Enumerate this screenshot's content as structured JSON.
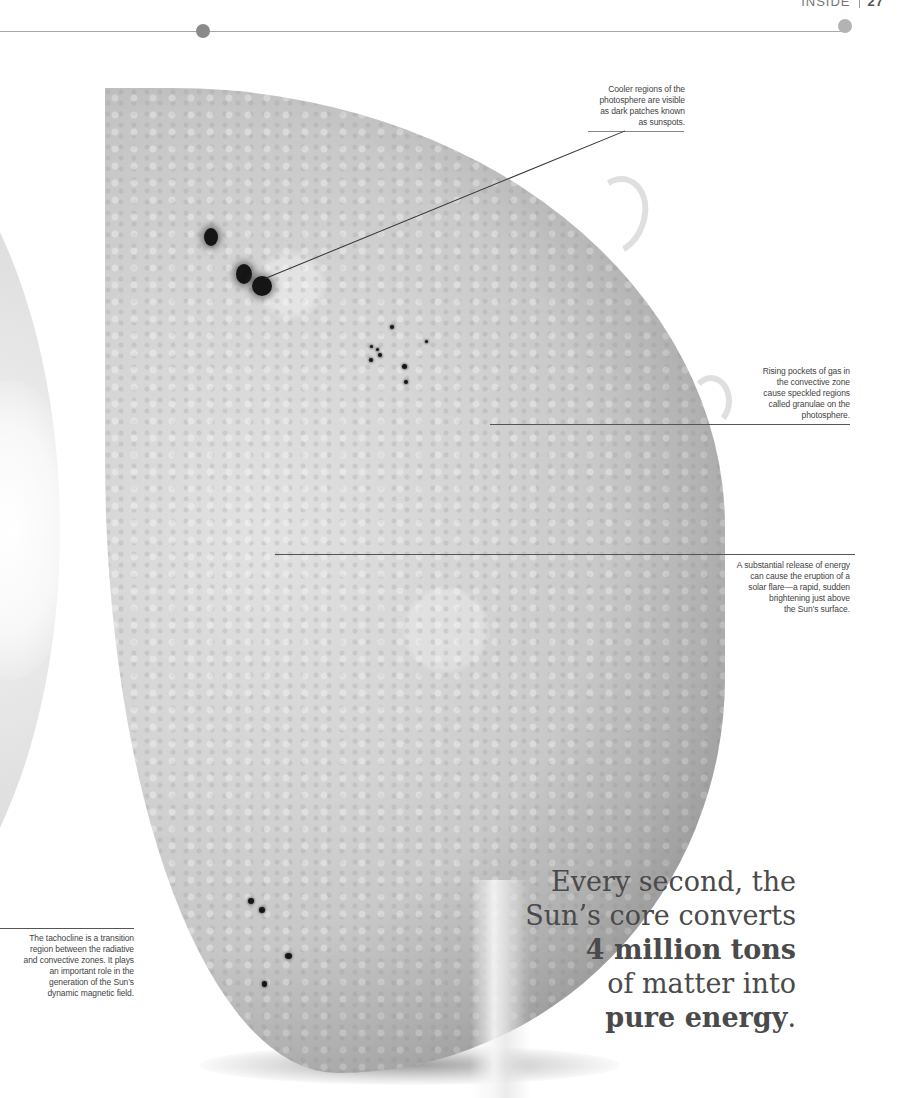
{
  "header": {
    "section": "INSIDE",
    "page_number": "27"
  },
  "callouts": {
    "sunspots": {
      "lines": [
        "Cooler regions of the",
        "photosphere are visible",
        "as dark patches known",
        "as sunspots."
      ]
    },
    "granulae": {
      "lines": [
        "Rising pockets of gas in",
        "the convective zone",
        "cause speckled regions",
        "called granulae on the",
        "photosphere."
      ]
    },
    "solar_flare": {
      "lines": [
        "A substantial release of energy",
        "can cause the eruption of a",
        "solar flare—a rapid, sudden",
        "brightening just above",
        "the Sun’s surface."
      ]
    },
    "tachocline": {
      "lines": [
        "The tachocline is a transition",
        "region between the radiative",
        "and convective zones. It plays",
        "an important role in the",
        "generation of the Sun’s",
        "dynamic magnetic field."
      ]
    }
  },
  "quote": {
    "line1": "Every second, the",
    "line2": "Sun’s core converts",
    "line3_bold": "4 million tons",
    "line4": "of matter into",
    "line5_bold": "pure energy",
    "line5_end": "."
  },
  "image": {
    "subject": "sun-photosphere-illustration"
  },
  "colors": {
    "rule": "#a8a8a8",
    "rule_dot": "#8a8a8a",
    "text": "#444444",
    "quote_text": "#4a4a4a"
  }
}
